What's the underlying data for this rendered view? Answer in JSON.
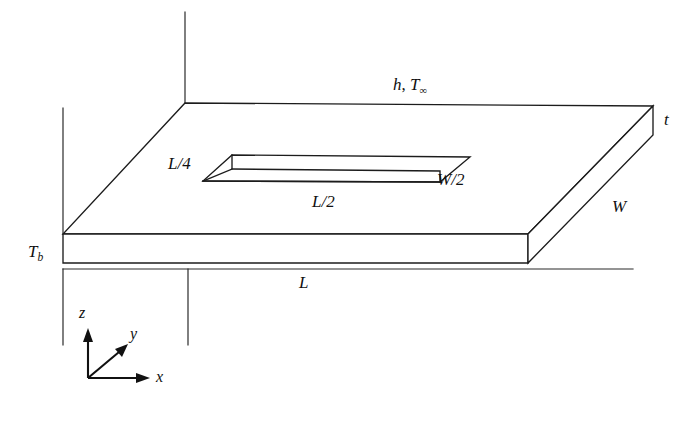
{
  "figure": {
    "background_color": "#ffffff",
    "line_color": "#1c1c1c"
  },
  "labels": {
    "convection": {
      "text_h": "h",
      "separator": ", ",
      "text_tinf_base": "T",
      "text_tinf_sub": "∞"
    },
    "thickness": "t",
    "width": "W",
    "half_width": "W/2",
    "length": "L",
    "half_length": "L/2",
    "quarter_length": "L/4",
    "base_temp_base": "T",
    "base_temp_sub": "b",
    "axis_x": "x",
    "axis_y": "y",
    "axis_z": "z"
  },
  "geometry": {
    "plate_top_face": "185,103 653,106 528,234 63,234",
    "plate_front_face": "63,234 528,234 528,263 63,263",
    "plate_right_face": "528,234 653,106 653,135 528,263",
    "groove_top_outline": "232,155 470,157 440,182 203,181",
    "groove_inner_floor": "232,155 470,157 440,182 203,181",
    "groove_left_wall": "232,155 232,170 203,181",
    "groove_bottom_rim": "203,181 440,182",
    "groove_inner_edge": "232,170 440,172 440,182",
    "groove_inner_line": "232,170 440,172",
    "leader_vertical_top": "185,12 185,103",
    "leader_vertical_left": "63,108 63,234",
    "dim_line_L": "63,269 633,269",
    "dim_tick_left": "63,269 63,345",
    "dim_tick_mid": "188,269 188,345",
    "axes_origin": "88,378",
    "axis_z_tip": "88,330",
    "axis_x_tip": "148,378",
    "axis_y_tip": "126,345"
  },
  "label_positions": {
    "convection": {
      "x": 393,
      "y": 76
    },
    "thickness": {
      "x": 664,
      "y": 111
    },
    "width": {
      "x": 612,
      "y": 198
    },
    "half_width": {
      "x": 437,
      "y": 171
    },
    "half_length": {
      "x": 312,
      "y": 195
    },
    "quarter_length": {
      "x": 168,
      "y": 155
    },
    "base_temp": {
      "x": 28,
      "y": 243
    },
    "length": {
      "x": 299,
      "y": 274
    },
    "axis_x": {
      "x": 156,
      "y": 370
    },
    "axis_y": {
      "x": 130,
      "y": 327
    },
    "axis_z": {
      "x": 79,
      "y": 306
    }
  }
}
